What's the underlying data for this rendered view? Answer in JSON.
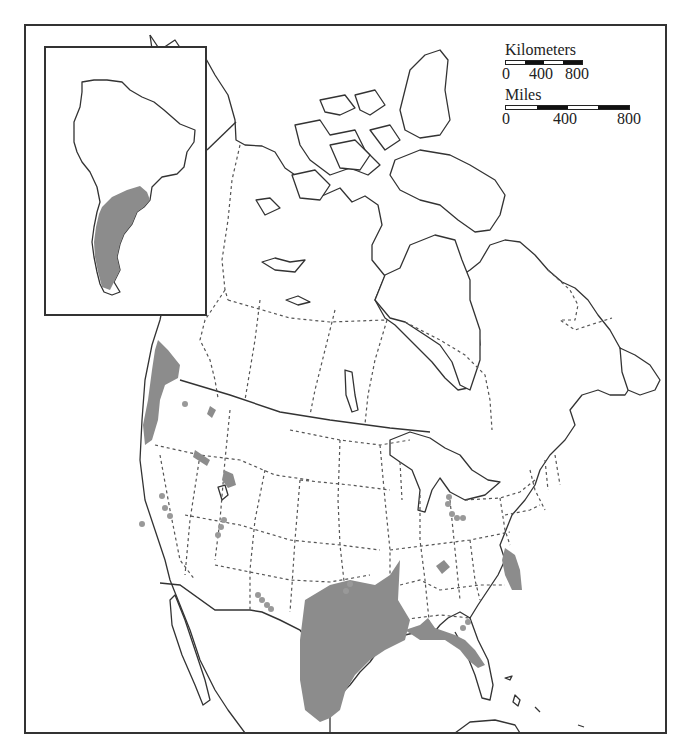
{
  "map": {
    "region": "North America",
    "inset_region": "South America",
    "colors": {
      "range_fill": "#8c8c8c",
      "point_records": "#999999",
      "outline": "#333333",
      "background": "#ffffff"
    },
    "legend": {
      "kilometers": {
        "title": "Kilometers",
        "ticks": [
          "0",
          "400",
          "800"
        ],
        "segments": 4
      },
      "miles": {
        "title": "Miles",
        "ticks": [
          "0",
          "400",
          "800"
        ],
        "segments": 4
      }
    },
    "shaded_ranges": [
      "Pacific Northwest coast (Washington/Oregon)",
      "Idaho/Utah interior patches",
      "Texas/Louisiana Gulf coast to Mexico",
      "Florida Gulf coast",
      "Virginia/North Carolina coast",
      "Kentucky/Tennessee patch",
      "Southern South America (Argentina/Chile)"
    ],
    "point_records": [
      "California coast",
      "Nevada",
      "Utah",
      "New Mexico",
      "Oklahoma",
      "Michigan/Ohio",
      "Georgia"
    ]
  }
}
